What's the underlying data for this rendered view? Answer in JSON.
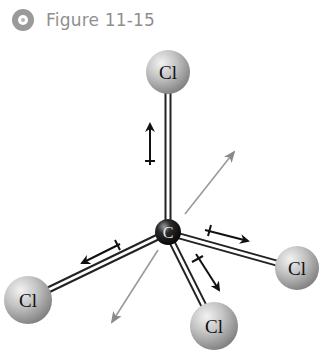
{
  "header": {
    "icon": "disc-icon",
    "title": "Figure 11-15"
  },
  "molecule": {
    "name": "CCl4",
    "central_atom": {
      "label": "C",
      "x": 168,
      "y": 232,
      "color": "#1a1a1a"
    },
    "peripheral_atoms": [
      {
        "id": "top",
        "label": "Cl",
        "x": 168,
        "y": 72,
        "color": "#b8b8b8"
      },
      {
        "id": "left",
        "label": "Cl",
        "x": 28,
        "y": 300,
        "color": "#b8b8b8"
      },
      {
        "id": "right",
        "label": "Cl",
        "x": 297,
        "y": 268,
        "color": "#b8b8b8"
      },
      {
        "id": "bottom",
        "label": "Cl",
        "x": 214,
        "y": 326,
        "color": "#b8b8b8"
      }
    ],
    "bond_dipoles": [
      {
        "target": "top",
        "direction": "toward Cl"
      },
      {
        "target": "left",
        "direction": "toward Cl"
      },
      {
        "target": "right",
        "direction": "toward Cl"
      },
      {
        "target": "bottom",
        "direction": "toward Cl"
      }
    ],
    "axis_arrows_color": "#8a8a8a",
    "dipole_arrow_color": "#111111"
  }
}
